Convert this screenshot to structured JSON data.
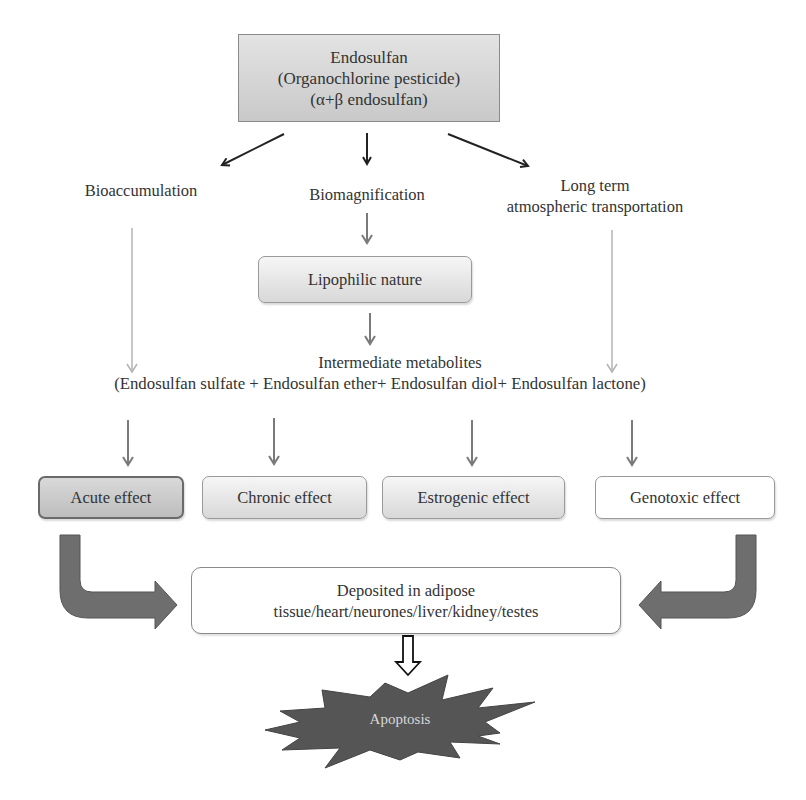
{
  "source_node": {
    "line1": "Endosulfan",
    "line2": "(Organochlorine pesticide)",
    "line3": "(α+β endosulfan)"
  },
  "branches": {
    "left": "Bioaccumulation",
    "center": "Biomagnification",
    "right_line1": "Long term",
    "right_line2": "atmospheric transportation"
  },
  "lipophilic_box": "Lipophilic nature",
  "metabolites": {
    "heading": "Intermediate metabolites",
    "list": "(Endosulfan sulfate + Endosulfan ether+ Endosulfan diol+ Endosulfan lactone)"
  },
  "effects": [
    {
      "label": "Acute effect",
      "style": "dark"
    },
    {
      "label": "Chronic effect",
      "style": "light"
    },
    {
      "label": "Estrogenic effect",
      "style": "light"
    },
    {
      "label": "Genotoxic effect",
      "style": "white"
    }
  ],
  "deposit": {
    "line1": "Deposited in adipose",
    "line2": "tissue/heart/neurones/liver/kidney/testes"
  },
  "outcome": "Apoptosis",
  "colors": {
    "dark_arrow": "#222222",
    "gray_arrow": "#7f7f7f",
    "light_arrow": "#b8b8b8",
    "bent_arrow": "#6e6e6e",
    "burst": "#555555"
  }
}
